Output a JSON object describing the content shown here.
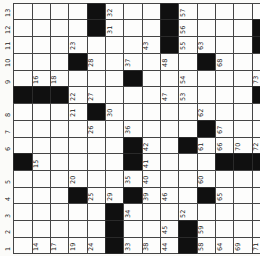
{
  "puzzle": {
    "name": "rotated-crossword-grid",
    "grid": {
      "rows": 15,
      "cols_visible": 14,
      "origin_x": 13.3,
      "origin_y": 2.7,
      "cell_w": 18.34,
      "cell_h": 16.73,
      "right_edge_clipped": true
    },
    "colors": {
      "paper": "#fbfbf9",
      "cell": "#fdfdfc",
      "grid_line": "#454545",
      "black_cell": "#101010",
      "number": "#1a1a1a"
    },
    "black_cells": [
      [
        1,
        5
      ],
      [
        2,
        5
      ],
      [
        7,
        5
      ],
      [
        1,
        9
      ],
      [
        2,
        9
      ],
      [
        3,
        9
      ],
      [
        2,
        14
      ],
      [
        3,
        14
      ],
      [
        4,
        4
      ],
      [
        12,
        4
      ],
      [
        4,
        11
      ],
      [
        8,
        11
      ],
      [
        12,
        11
      ],
      [
        5,
        7
      ],
      [
        9,
        7
      ],
      [
        10,
        7
      ],
      [
        12,
        7
      ],
      [
        6,
        1
      ],
      [
        6,
        2
      ],
      [
        6,
        3
      ],
      [
        6,
        14
      ],
      [
        9,
        10
      ],
      [
        14,
        10
      ],
      [
        15,
        10
      ],
      [
        10,
        1
      ],
      [
        10,
        12
      ],
      [
        10,
        13
      ],
      [
        10,
        14
      ],
      [
        13,
        6
      ],
      [
        14,
        6
      ],
      [
        15,
        6
      ]
    ],
    "numbers": [
      [
        1,
        1,
        "13"
      ],
      [
        1,
        6,
        "32"
      ],
      [
        1,
        10,
        "57"
      ],
      [
        2,
        1,
        "12"
      ],
      [
        2,
        6,
        "31"
      ],
      [
        2,
        10,
        "56"
      ],
      [
        3,
        1,
        "11"
      ],
      [
        3,
        4,
        "23"
      ],
      [
        3,
        8,
        "43"
      ],
      [
        3,
        10,
        "55"
      ],
      [
        3,
        11,
        "63"
      ],
      [
        4,
        1,
        "10"
      ],
      [
        4,
        5,
        "28"
      ],
      [
        4,
        7,
        "37"
      ],
      [
        4,
        9,
        "48"
      ],
      [
        4,
        12,
        "68"
      ],
      [
        5,
        1,
        "9"
      ],
      [
        5,
        2,
        "16"
      ],
      [
        5,
        3,
        "18"
      ],
      [
        5,
        10,
        "54"
      ],
      [
        5,
        14,
        "73"
      ],
      [
        6,
        4,
        "22"
      ],
      [
        6,
        5,
        "27"
      ],
      [
        6,
        9,
        "47"
      ],
      [
        6,
        10,
        "53"
      ],
      [
        7,
        1,
        "8"
      ],
      [
        7,
        4,
        "21"
      ],
      [
        7,
        6,
        "30"
      ],
      [
        7,
        11,
        "62"
      ],
      [
        8,
        1,
        "7"
      ],
      [
        8,
        5,
        "26"
      ],
      [
        8,
        7,
        "36"
      ],
      [
        8,
        12,
        "67"
      ],
      [
        9,
        1,
        "6"
      ],
      [
        9,
        8,
        "42"
      ],
      [
        9,
        11,
        "61"
      ],
      [
        9,
        12,
        "66"
      ],
      [
        9,
        13,
        "70"
      ],
      [
        9,
        14,
        "72"
      ],
      [
        10,
        2,
        "15"
      ],
      [
        10,
        8,
        "41"
      ],
      [
        11,
        1,
        "5"
      ],
      [
        11,
        4,
        "20"
      ],
      [
        11,
        7,
        "35"
      ],
      [
        11,
        8,
        "40"
      ],
      [
        11,
        11,
        "60"
      ],
      [
        12,
        1,
        "4"
      ],
      [
        12,
        5,
        "25"
      ],
      [
        12,
        6,
        "29"
      ],
      [
        12,
        8,
        "39"
      ],
      [
        12,
        9,
        "46"
      ],
      [
        12,
        12,
        "65"
      ],
      [
        13,
        1,
        "3"
      ],
      [
        13,
        7,
        "34"
      ],
      [
        13,
        10,
        "52"
      ],
      [
        14,
        1,
        "2"
      ],
      [
        14,
        9,
        "45"
      ],
      [
        14,
        11,
        "59"
      ],
      [
        15,
        1,
        "1"
      ],
      [
        15,
        2,
        "14"
      ],
      [
        15,
        3,
        "17"
      ],
      [
        15,
        4,
        "19"
      ],
      [
        15,
        5,
        "24"
      ],
      [
        15,
        7,
        "33"
      ],
      [
        15,
        8,
        "38"
      ],
      [
        15,
        9,
        "44"
      ],
      [
        15,
        11,
        "58"
      ],
      [
        15,
        12,
        "64"
      ],
      [
        15,
        13,
        "69"
      ],
      [
        15,
        14,
        "71"
      ]
    ]
  }
}
